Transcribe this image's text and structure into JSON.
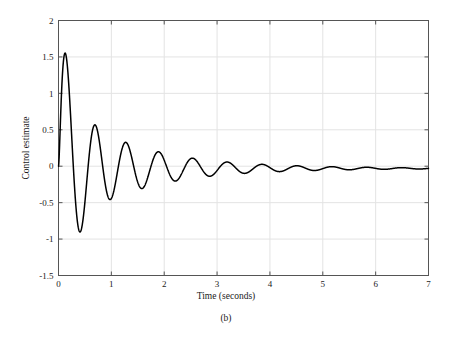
{
  "chart_data": {
    "type": "line",
    "title": "",
    "subtitle": "",
    "caption": "(b)",
    "xlabel": "Time (seconds)",
    "ylabel": "Control estimate",
    "xlim": [
      0,
      7
    ],
    "ylim": [
      -1.5,
      2
    ],
    "xticks": [
      0,
      1,
      2,
      3,
      4,
      5,
      6,
      7
    ],
    "xticklabels": [
      "0",
      "1",
      "2",
      "3",
      "4",
      "5",
      "6",
      "7"
    ],
    "yticks": [
      -1.5,
      -1,
      -0.5,
      0,
      0.5,
      1,
      1.5,
      2
    ],
    "yticklabels": [
      "-1.5",
      "-1",
      "-0.5",
      "0",
      "0.5",
      "1",
      "1.5",
      "2"
    ],
    "grid": true,
    "grid_color": "#e3e3e3",
    "legend": null,
    "line_color": "#000000",
    "line_width": 1.5,
    "series": [
      {
        "name": "control estimate",
        "description": "Damped oscillatory control signal decaying to a small negative steady-state offset",
        "steady_state": -0.03,
        "peaks_x": [
          0.07,
          0.35,
          1.07,
          1.4,
          1.72,
          2.07,
          2.4,
          2.73,
          3.06,
          3.39,
          3.72,
          4.05,
          4.38,
          4.71,
          5.04,
          5.37,
          5.7,
          6.03,
          6.36,
          6.69
        ],
        "peaks_y": [
          1.82,
          1.79,
          0.78,
          0.55,
          0.21,
          0.31,
          0.22,
          0.15,
          0.11,
          0.09,
          0.06,
          0.04,
          0.03,
          0.02,
          0.01,
          0.005,
          0.0,
          -0.01,
          -0.015,
          -0.02
        ],
        "troughs_x": [
          0.2,
          0.6,
          0.9,
          1.25,
          1.57,
          1.9,
          2.23,
          2.56,
          2.89,
          3.22,
          3.55,
          3.88,
          4.21,
          4.54,
          4.87,
          5.2,
          5.53,
          5.86,
          6.19,
          6.52
        ],
        "troughs_y": [
          -0.23,
          -1.23,
          -1.05,
          -0.25,
          -0.53,
          -0.38,
          -0.26,
          -0.2,
          -0.16,
          -0.13,
          -0.1,
          -0.08,
          -0.07,
          -0.06,
          -0.05,
          -0.045,
          -0.04,
          -0.04,
          -0.035,
          -0.033
        ],
        "x": [
          0.0,
          0.7,
          1.4,
          2.1,
          2.8,
          3.5,
          4.2,
          4.9,
          5.6,
          6.3,
          7.0
        ],
        "y": [
          0.0,
          -0.95,
          0.55,
          -0.08,
          -0.2,
          -0.09,
          -0.06,
          -0.05,
          -0.04,
          -0.03,
          -0.03
        ]
      }
    ]
  }
}
